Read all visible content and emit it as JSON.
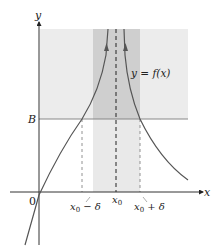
{
  "figure": {
    "axes": {
      "x_label": "x",
      "y_label": "y",
      "origin_label": "0"
    },
    "labels": {
      "B": "B",
      "curve": "y = f(x)",
      "x0": "x",
      "x0_sub": "0",
      "x0_minus_delta": "x",
      "x0_minus_delta_sub": "0",
      "x0_minus_delta_rest": " − δ",
      "x0_plus_delta": "x",
      "x0_plus_delta_sub": "0",
      "x0_plus_delta_rest": " + δ"
    },
    "colors": {
      "region_light": "#ececec",
      "band_dark": "#cfcfcf",
      "band_light": "#e6e6e6",
      "curve": "#555555",
      "axis": "#333333",
      "B_line": "#777777"
    }
  }
}
